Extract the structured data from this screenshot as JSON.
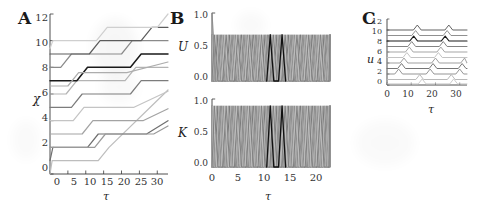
{
  "figure": {
    "background": "#ffffff",
    "panels": [
      "A",
      "B",
      "C"
    ]
  },
  "panelA": {
    "letter": "A",
    "ylabel": "χ",
    "xlabel": "τ",
    "yticks": [
      "0",
      "2",
      "4",
      "6",
      "8",
      "10",
      "12"
    ],
    "xticks": [
      "0",
      "5",
      "10",
      "15",
      "20",
      "25",
      "30"
    ]
  },
  "panelB": {
    "letter": "B",
    "upper_ylabel": "U",
    "lower_ylabel": "K",
    "xlabel": "τ",
    "upper_yticks": [
      "0.0",
      "0.5",
      "1.0"
    ],
    "lower_yticks": [
      "0.0",
      "0.5",
      "1.0"
    ],
    "xticks": [
      "0",
      "5",
      "10",
      "15",
      "20"
    ]
  },
  "panelC": {
    "letter": "C",
    "ylabel": "u",
    "xlabel": "τ",
    "yticks": [
      "0",
      "2",
      "4",
      "6",
      "8",
      "10",
      "12"
    ],
    "xticks": [
      "0",
      "10",
      "20",
      "30"
    ]
  },
  "colors": {
    "axis": "#3a3a3a",
    "text": "#222222",
    "highlight": "#111111",
    "gray_light": "#c9c9c9",
    "gray_mid": "#8f8f8f",
    "gray_dark": "#5a5a5a"
  },
  "chart_data": [
    {
      "type": "line",
      "panel": "A",
      "title": "",
      "xlabel": "τ",
      "ylabel": "χ",
      "xlim": [
        0,
        33
      ],
      "ylim": [
        0,
        12
      ],
      "xticks": [
        0,
        5,
        10,
        15,
        20,
        25,
        30
      ],
      "yticks": [
        0,
        2,
        4,
        6,
        8,
        10,
        12
      ],
      "grid": false,
      "legend": "none",
      "description": "Twelve staircase traces: each starts at an integer level, holds flat, then ramps up by two units, holds, then ramps again.",
      "series": [
        {
          "name": "chi-0",
          "shade": "#bdbdbd",
          "x": [
            0,
            0.6,
            13.5,
            16.5,
            33
          ],
          "values": [
            0,
            1,
            1,
            2,
            6.3
          ]
        },
        {
          "name": "chi-1",
          "shade": "#6f6f6f",
          "x": [
            0,
            0.8,
            10.5,
            13.5,
            27.0,
            33
          ],
          "values": [
            1,
            2,
            2,
            3,
            3,
            4
          ]
        },
        {
          "name": "chi-2",
          "shade": "#a3a3a3",
          "x": [
            0,
            9.0,
            12.0,
            26.0,
            33
          ],
          "values": [
            3,
            3,
            4,
            4,
            4.9
          ]
        },
        {
          "name": "chi-3",
          "shade": "#c4c4c4",
          "x": [
            0,
            6.5,
            9.5,
            23.5,
            33
          ],
          "values": [
            4,
            4,
            5,
            5,
            6.2
          ]
        },
        {
          "name": "chi-4",
          "shade": "#7c7c7c",
          "x": [
            0,
            6.0,
            9.0,
            22.5,
            25.5,
            33
          ],
          "values": [
            5,
            5,
            6,
            6,
            7,
            7
          ]
        },
        {
          "name": "chi-5",
          "shade": "#b4b4b4",
          "x": [
            0,
            4.5,
            7.5,
            21.0,
            24.0,
            33
          ],
          "values": [
            6,
            6,
            7,
            7,
            8,
            8
          ]
        },
        {
          "name": "chi-6",
          "shade": "#1a1a1a",
          "x": [
            0,
            7.5,
            10.5,
            22.5,
            25.5,
            33
          ],
          "values": [
            7,
            7,
            8,
            8,
            9,
            9
          ]
        },
        {
          "name": "chi-7",
          "shade": "#8a8a8a",
          "x": [
            0,
            3.0,
            6.0,
            20.0,
            23.0,
            33
          ],
          "values": [
            8,
            8,
            9,
            9,
            10,
            10
          ]
        },
        {
          "name": "chi-8",
          "shade": "#5c5c5c",
          "x": [
            0,
            11.0,
            14.0,
            25.5,
            28.5,
            33
          ],
          "values": [
            9,
            9,
            10,
            10,
            11,
            11
          ]
        },
        {
          "name": "chi-9",
          "shade": "#cfcfcf",
          "x": [
            0,
            0.8,
            13.0,
            16.0,
            30.0,
            33
          ],
          "values": [
            9.4,
            10,
            10,
            11,
            11,
            12
          ]
        },
        {
          "name": "chi-10",
          "shade": "#9a9a9a",
          "x": [
            0,
            12.5,
            15.5,
            29.0,
            33
          ],
          "values": [
            2,
            2,
            3,
            3,
            3.6
          ]
        },
        {
          "name": "chi-11",
          "shade": "#adadad",
          "x": [
            0,
            5.0,
            8.0,
            21.5,
            33
          ],
          "values": [
            6.6,
            6.6,
            7.6,
            7.6,
            8.4
          ]
        }
      ]
    },
    {
      "type": "line",
      "panel": "B-upper",
      "title": "",
      "xlabel": "",
      "ylabel": "U",
      "xlim": [
        0,
        22
      ],
      "ylim": [
        0.0,
        1.0
      ],
      "xticks": [
        0,
        5,
        10,
        15,
        20
      ],
      "yticks": [
        0.0,
        0.5,
        1.0
      ],
      "grid": false,
      "legend": "none",
      "description": "Ten overlapping triangular oscillators of period ~2.2 in tau, amplitude ~0.68, staggered in phase; one trace near tau=11 is drawn black. First trace starts at U=1.0 at tau=0 and decays into the cycle.",
      "n_series": 10,
      "period": 2.2,
      "peak_amplitude": 0.68,
      "baseline": 0.0,
      "highlight_phase_index": 5
    },
    {
      "type": "line",
      "panel": "B-lower",
      "title": "",
      "xlabel": "τ",
      "ylabel": "K",
      "xlim": [
        0,
        22
      ],
      "ylim": [
        0.0,
        1.0
      ],
      "xticks": [
        0,
        5,
        10,
        15,
        20
      ],
      "yticks": [
        0.0,
        0.5,
        1.0
      ],
      "grid": false,
      "legend": "none",
      "description": "Ten overlapping triangular oscillators of period ~2.2 in tau, amplitude ~0.9, staggered in phase; one trace near tau=11 is drawn black.",
      "n_series": 10,
      "period": 2.2,
      "peak_amplitude": 0.9,
      "baseline": 0.0,
      "highlight_phase_index": 5
    },
    {
      "type": "line",
      "panel": "C",
      "title": "",
      "xlabel": "τ",
      "ylabel": "u",
      "xlim": [
        0,
        33
      ],
      "ylim": [
        0,
        12
      ],
      "xticks": [
        0,
        10,
        20,
        30
      ],
      "yticks": [
        0,
        2,
        4,
        6,
        8,
        10,
        12
      ],
      "grid": false,
      "legend": "none",
      "description": "Eleven flat baselines at successive integer u levels, each carrying short upward pulses that recur about every 13 tau units; pulse times shift later for lower baselines, producing a diagonal cascade.",
      "n_series": 11,
      "pulse_period": 13,
      "pulse_height": 0.9,
      "series": [
        {
          "name": "u-10",
          "shade": "#5a5a5a",
          "baseline": 10,
          "pulse_times": [
            12.5,
            25.5
          ]
        },
        {
          "name": "u-9",
          "shade": "#8a8a8a",
          "baseline": 9,
          "pulse_times": [
            11.8,
            24.8
          ]
        },
        {
          "name": "u-8",
          "shade": "#1a1a1a",
          "baseline": 8,
          "pulse_times": [
            11.0,
            24.0
          ]
        },
        {
          "name": "u-7",
          "shade": "#7c7c7c",
          "baseline": 7,
          "pulse_times": [
            10.2,
            23.2
          ]
        },
        {
          "name": "u-6",
          "shade": "#a0a0a0",
          "baseline": 6,
          "pulse_times": [
            9.2,
            22.2
          ]
        },
        {
          "name": "u-5",
          "shade": "#c0c0c0",
          "baseline": 5,
          "pulse_times": [
            8.2,
            21.2
          ]
        },
        {
          "name": "u-4",
          "shade": "#9a9a9a",
          "baseline": 4,
          "pulse_times": [
            7.0,
            20.0,
            32.0
          ]
        },
        {
          "name": "u-3",
          "shade": "#6f6f6f",
          "baseline": 3,
          "pulse_times": [
            6.0,
            19.0,
            31.0
          ]
        },
        {
          "name": "u-2",
          "shade": "#8f8f8f",
          "baseline": 2,
          "pulse_times": [
            4.8,
            17.8,
            30.0
          ]
        },
        {
          "name": "u-1",
          "shade": "#b5b5b5",
          "baseline": 1,
          "pulse_times": [
            13.5,
            26.5
          ]
        },
        {
          "name": "u-0",
          "shade": "#c8c8c8",
          "baseline": 0.2,
          "pulse_times": [
            14.5,
            27.5
          ]
        }
      ]
    }
  ]
}
